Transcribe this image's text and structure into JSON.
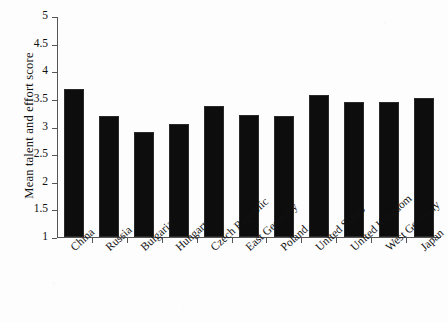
{
  "chart_data": {
    "type": "bar",
    "title": "",
    "xlabel": "",
    "ylabel": "Mean talent and effort score",
    "ylim": [
      1,
      5
    ],
    "ytick_labels": [
      "5",
      "4.5",
      "4",
      "3.5",
      "3",
      "2.5",
      "2",
      "1.5",
      "1"
    ],
    "ytick_values": [
      5,
      4.5,
      4,
      3.5,
      3,
      2.5,
      2,
      1.5,
      1
    ],
    "grid": false,
    "legend": null,
    "bar_color": "#0d0d0d",
    "categories": [
      "China",
      "Russia",
      "Bulgaria",
      "Hungary",
      "Czech Republic",
      "East Germany",
      "Poland",
      "United States",
      "United Kingdom",
      "West Germany",
      "Japan"
    ],
    "values": [
      3.67,
      3.19,
      2.9,
      3.04,
      3.38,
      3.2,
      3.19,
      3.57,
      3.44,
      3.44,
      3.51
    ]
  }
}
